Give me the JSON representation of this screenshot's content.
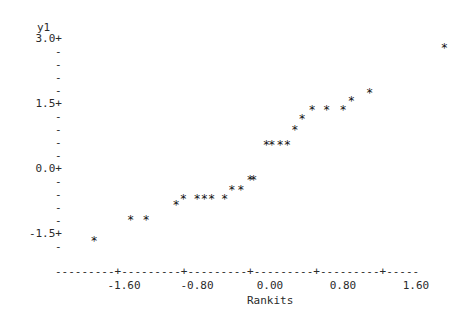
{
  "plot": {
    "y_axis_title": "y1",
    "x_axis_title": "Rankits",
    "marker_glyph": "*",
    "axis_tick_glyph": "+",
    "axis_dash_glyph": "-",
    "y_ticks": [
      {
        "label": "3.0+",
        "value": 3.0
      },
      {
        "label": "1.5+",
        "value": 1.5
      },
      {
        "label": "0.0+",
        "value": 0.0
      },
      {
        "label": "-1.5+",
        "value": -1.5
      }
    ],
    "y_minor_glyph": "-",
    "y_minor_count_between": 4,
    "x_ticks": [
      {
        "label": "-1.60",
        "value": -1.6
      },
      {
        "label": "-0.80",
        "value": -0.8
      },
      {
        "label": "0.00",
        "value": 0.0
      },
      {
        "label": "0.80",
        "value": 0.8
      },
      {
        "label": "1.60",
        "value": 1.6
      }
    ],
    "x_axis_rule": "---------+---------+---------+---------+---------+-----"
  },
  "chart_data": {
    "type": "scatter",
    "title": "",
    "xlabel": "Rankits",
    "ylabel": "y1",
    "xlim": [
      -2.02,
      2.22
    ],
    "ylim": [
      -1.85,
      3.3
    ],
    "grid": false,
    "legend": "none",
    "marker": "*",
    "n_points": 25,
    "x": [
      -1.93,
      -1.53,
      -1.36,
      -1.03,
      -0.95,
      -0.8,
      -0.72,
      -0.64,
      -0.5,
      -0.42,
      -0.32,
      -0.22,
      -0.18,
      -0.04,
      0.02,
      0.11,
      0.19,
      0.27,
      0.35,
      0.46,
      0.62,
      0.8,
      0.89,
      1.09,
      1.91
    ],
    "y": [
      -1.7,
      -1.21,
      -1.21,
      -0.86,
      -0.72,
      -0.72,
      -0.72,
      -0.72,
      -0.72,
      -0.51,
      -0.51,
      -0.28,
      -0.28,
      0.51,
      0.51,
      0.51,
      0.51,
      0.86,
      1.11,
      1.32,
      1.32,
      1.32,
      1.53,
      1.73,
      2.75
    ]
  }
}
